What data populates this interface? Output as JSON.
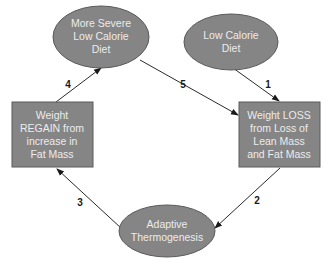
{
  "colors": {
    "node_fill": "#858585",
    "node_stroke": "#5a5a5a",
    "node_text": "#ececec",
    "edge": "#2a2a2a",
    "label": "#1a1a1a",
    "background": "#ffffff"
  },
  "nodes": [
    {
      "id": "more-severe-diet",
      "shape": "ellipse",
      "lines": [
        "More Severe",
        "Low Calorie",
        "Diet"
      ]
    },
    {
      "id": "low-calorie-diet",
      "shape": "ellipse",
      "lines": [
        "Low Calorie",
        "Diet"
      ]
    },
    {
      "id": "weight-regain",
      "shape": "rect",
      "lines": [
        "Weight",
        "REGAIN from",
        "increase in",
        "Fat Mass"
      ]
    },
    {
      "id": "weight-loss",
      "shape": "rect",
      "lines": [
        "Weight LOSS",
        "from Loss of",
        "Lean Mass",
        "and Fat Mass"
      ]
    },
    {
      "id": "adaptive-thermogenesis",
      "shape": "ellipse",
      "lines": [
        "Adaptive",
        "Thermogenesis"
      ]
    }
  ],
  "edges": [
    {
      "label": "1",
      "from": "low-calorie-diet",
      "to": "weight-loss"
    },
    {
      "label": "2",
      "from": "weight-loss",
      "to": "adaptive-thermogenesis"
    },
    {
      "label": "3",
      "from": "adaptive-thermogenesis",
      "to": "weight-regain"
    },
    {
      "label": "4",
      "from": "weight-regain",
      "to": "more-severe-diet"
    },
    {
      "label": "5",
      "from": "more-severe-diet",
      "to": "weight-loss"
    }
  ]
}
